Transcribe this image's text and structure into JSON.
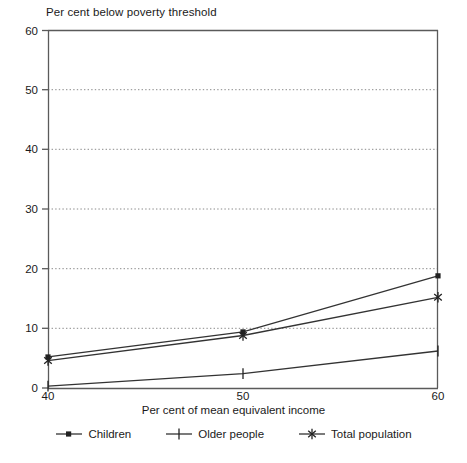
{
  "chart_data": {
    "type": "line",
    "title": "Per cent below poverty threshold",
    "xlabel": "Per cent of mean equivalent income",
    "ylabel": "",
    "x": [
      40,
      50,
      60
    ],
    "xlim": [
      40,
      60
    ],
    "ylim": [
      0,
      60
    ],
    "xticks": [
      "40",
      "50",
      "60"
    ],
    "yticks": [
      "0",
      "10",
      "20",
      "30",
      "40",
      "50",
      "60"
    ],
    "grid": "horizontal-dotted",
    "legend_position": "bottom",
    "series": [
      {
        "name": "Children",
        "marker": "square",
        "values": [
          5.2,
          9.4,
          18.8
        ]
      },
      {
        "name": "Older people",
        "marker": "plus",
        "values": [
          0.3,
          2.4,
          6.2
        ]
      },
      {
        "name": "Total population",
        "marker": "asterisk",
        "values": [
          4.6,
          8.8,
          15.2
        ]
      }
    ],
    "line_color": "#333333",
    "axis_color": "#5a5a5a",
    "grid_color": "#808080"
  },
  "axis": {
    "y_ticks": [
      "60",
      "50",
      "40",
      "30",
      "20",
      "10",
      "0"
    ],
    "x_ticks": [
      "40",
      "50",
      "60"
    ]
  },
  "legend": {
    "items": [
      {
        "label": "Children",
        "marker": "square-marker-icon"
      },
      {
        "label": "Older people",
        "marker": "plus-marker-icon"
      },
      {
        "label": "Total population",
        "marker": "asterisk-marker-icon"
      }
    ]
  },
  "caption": {
    "fragment": ""
  }
}
